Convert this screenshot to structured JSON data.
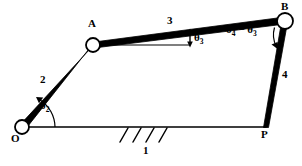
{
  "figure": {
    "kind": "four-bar-linkage-kinematic-diagram",
    "background_color": "#ffffff",
    "stroke_color": "#000000"
  },
  "joints": [
    {
      "id": "O",
      "label": "O",
      "x": 22,
      "y": 127,
      "type": "pivot-ground",
      "radius": 7
    },
    {
      "id": "A",
      "label": "A",
      "x": 93,
      "y": 45,
      "type": "pivot",
      "radius": 7
    },
    {
      "id": "B",
      "label": "B",
      "x": 285,
      "y": 21,
      "type": "pivot",
      "radius": 8
    },
    {
      "id": "P",
      "label": "P",
      "x": 266,
      "y": 127,
      "type": "point",
      "radius": 0
    }
  ],
  "links": [
    {
      "id": "1",
      "label": "1",
      "from": "O",
      "to": "P",
      "role": "ground"
    },
    {
      "id": "2",
      "label": "2",
      "from": "O",
      "to": "A",
      "role": "crank"
    },
    {
      "id": "3",
      "label": "3",
      "from": "A",
      "to": "B",
      "role": "coupler"
    },
    {
      "id": "4",
      "label": "4",
      "from": "P",
      "to": "B",
      "role": "rocker"
    }
  ],
  "link_labels": [
    {
      "text": "1",
      "x": 145,
      "y": 149
    },
    {
      "text": "2",
      "x": 42,
      "y": 78
    },
    {
      "text": "3",
      "x": 168,
      "y": 18
    },
    {
      "text": "4",
      "x": 283,
      "y": 72
    }
  ],
  "joint_labels": [
    {
      "text": "O",
      "x": 14,
      "y": 141
    },
    {
      "text": "A",
      "x": 89,
      "y": 22
    },
    {
      "text": "B",
      "x": 282,
      "y": 3
    },
    {
      "text": "P",
      "x": 262,
      "y": 131
    }
  ],
  "angles": [
    {
      "id": "theta2",
      "base": "θ",
      "sub": "2",
      "label": "θ₂",
      "x": 42,
      "y": 105,
      "vertex": "O",
      "between": [
        "ground-link-1",
        "link-2"
      ]
    },
    {
      "id": "theta3",
      "base": "θ",
      "sub": "3",
      "label": "θ₃",
      "x": 193,
      "y": 37,
      "vertex": "A",
      "between": [
        "horizontal-reference",
        "link-3"
      ]
    },
    {
      "id": "theta4_minus_theta3",
      "text_parts": [
        "θ",
        "4",
        " − ",
        "θ",
        "3"
      ],
      "label": "θ₄ − θ₃",
      "x": 227,
      "y": 27,
      "vertex": "B",
      "between": [
        "link-3",
        "link-4"
      ]
    }
  ],
  "reference_line": {
    "name": "horizontal-reference-from-A",
    "from_x": 93,
    "from_y": 45,
    "to_x": 190,
    "to_y": 45
  },
  "ground_hatching": {
    "name": "ground-hatch-marks",
    "count": 4,
    "start_x": 128,
    "y": 128,
    "spacing": 13,
    "length": 14,
    "slant_dx": 8
  }
}
